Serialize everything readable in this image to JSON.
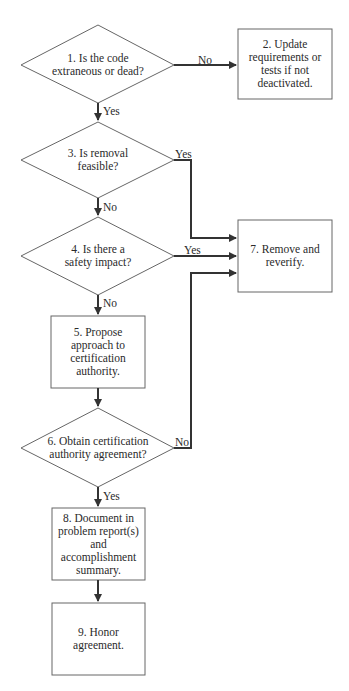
{
  "diagram": {
    "type": "flowchart",
    "nodes": [
      {
        "id": "1",
        "shape": "decision",
        "label": "1. Is the code\nextraneous or dead?"
      },
      {
        "id": "2",
        "shape": "process",
        "label": "2. Update\nrequirements or\ntests if not\ndeactivated."
      },
      {
        "id": "3",
        "shape": "decision",
        "label": "3. Is removal\nfeasible?"
      },
      {
        "id": "4",
        "shape": "decision",
        "label": "4. Is there a\nsafety impact?"
      },
      {
        "id": "5",
        "shape": "process",
        "label": "5. Propose\napproach to\ncertification\nauthority."
      },
      {
        "id": "6",
        "shape": "decision",
        "label": "6. Obtain certification\nauthority agreement?"
      },
      {
        "id": "7",
        "shape": "process",
        "label": "7. Remove and\nreverify."
      },
      {
        "id": "8",
        "shape": "process",
        "label": "8. Document in\nproblem report(s)\nand\naccomplishment\nsummary."
      },
      {
        "id": "9",
        "shape": "process",
        "label": "9. Honor\nagreement."
      }
    ],
    "edges": [
      {
        "from": "1",
        "to": "2",
        "label": "No"
      },
      {
        "from": "1",
        "to": "3",
        "label": "Yes"
      },
      {
        "from": "3",
        "to": "7",
        "label": "Yes"
      },
      {
        "from": "3",
        "to": "4",
        "label": "No"
      },
      {
        "from": "4",
        "to": "7",
        "label": "Yes"
      },
      {
        "from": "4",
        "to": "5",
        "label": "No"
      },
      {
        "from": "5",
        "to": "6",
        "label": ""
      },
      {
        "from": "6",
        "to": "7",
        "label": "No"
      },
      {
        "from": "6",
        "to": "8",
        "label": "Yes"
      },
      {
        "from": "8",
        "to": "9",
        "label": ""
      }
    ],
    "colors": {
      "stroke": "#555555",
      "arrow": "#333333",
      "text": "#2a2a2a",
      "background": "#ffffff"
    }
  }
}
